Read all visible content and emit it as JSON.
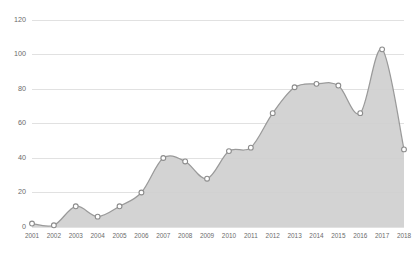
{
  "chart_data": {
    "type": "area",
    "title": "",
    "subtitle": "",
    "xlabel": "",
    "ylabel": "",
    "categories": [
      "2001",
      "2002",
      "2003",
      "2004",
      "2005",
      "2006",
      "2007",
      "2008",
      "2009",
      "2010",
      "2011",
      "2012",
      "2013",
      "2014",
      "2015",
      "2016",
      "2017",
      "2018"
    ],
    "values": [
      2,
      1,
      12,
      6,
      12,
      20,
      40,
      38,
      28,
      44,
      46,
      66,
      81,
      83,
      82,
      66,
      103,
      45
    ],
    "series": [
      {
        "name": "series-1",
        "values": [
          2,
          1,
          12,
          6,
          12,
          20,
          40,
          38,
          28,
          44,
          46,
          66,
          81,
          83,
          82,
          66,
          103,
          45
        ]
      }
    ],
    "ylim": [
      0,
      120
    ],
    "yticks": [
      0,
      20,
      40,
      60,
      80,
      100,
      120
    ],
    "ytick_labels": [
      "0",
      "20",
      "40",
      "60",
      "80",
      "100",
      "120"
    ],
    "xtick_labels": [
      "2001",
      "2002",
      "2003",
      "2004",
      "2005",
      "2006",
      "2007",
      "2008",
      "2009",
      "2010",
      "2011",
      "2012",
      "2013",
      "2014",
      "2015",
      "2016",
      "2017",
      "2018"
    ],
    "grid": true,
    "grid_axis": "y",
    "legend": false,
    "legend_position": "none",
    "markers": true,
    "smoothing": "spline",
    "colors": {
      "area_fill": "#cfcfcf",
      "line": "#9a9a9a",
      "marker_fill": "#ffffff",
      "marker_stroke": "#8c8c8c",
      "gridline": "#d9d9d9",
      "tick_label": "#6b6b6b",
      "background": "#ffffff"
    },
    "annotations": []
  }
}
